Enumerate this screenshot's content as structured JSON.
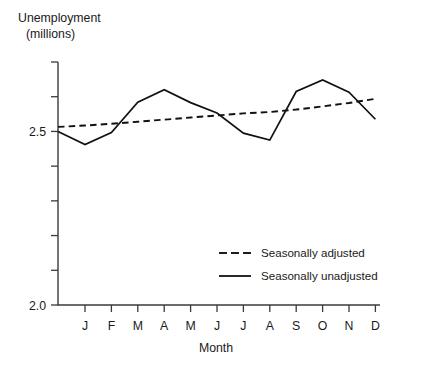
{
  "chart_data": {
    "type": "line",
    "title": "",
    "xlabel": "Month",
    "ylabel": "Unemployment\n(millions)",
    "ylabel_line1": "Unemployment",
    "ylabel_line2": "(millions)",
    "categories": [
      "J",
      "F",
      "M",
      "A",
      "M",
      "J",
      "J",
      "A",
      "S",
      "O",
      "N",
      "D"
    ],
    "x": [
      1,
      2,
      3,
      4,
      5,
      6,
      7,
      8,
      9,
      10,
      11,
      12
    ],
    "ylim": [
      2.0,
      2.7
    ],
    "xlim": [
      0,
      12.6
    ],
    "ytick_labels": [
      "2.0",
      "2.5"
    ],
    "ytick_values": [
      2.0,
      2.5
    ],
    "yticks_minor": [
      2.1,
      2.2,
      2.3,
      2.4,
      2.6,
      2.7
    ],
    "grid": false,
    "legend_position": "inside-lower-right",
    "series": [
      {
        "name": "Seasonally adjusted",
        "style": "dashed",
        "color": "#111111",
        "x_start_at_axis": 0,
        "y_at_axis": 2.513,
        "values": [
          2.517,
          2.522,
          2.528,
          2.534,
          2.54,
          2.546,
          2.552,
          2.556,
          2.563,
          2.572,
          2.582,
          2.594
        ]
      },
      {
        "name": "Seasonally unadjusted",
        "style": "solid",
        "color": "#111111",
        "x_start_at_axis": 0,
        "y_at_axis": 2.5,
        "values": [
          2.462,
          2.497,
          2.584,
          2.62,
          2.583,
          2.553,
          2.495,
          2.475,
          2.615,
          2.648,
          2.613,
          2.535
        ]
      }
    ],
    "legend": [
      {
        "label": "Seasonally adjusted",
        "style": "dashed"
      },
      {
        "label": "Seasonally unadjusted",
        "style": "solid"
      }
    ]
  }
}
